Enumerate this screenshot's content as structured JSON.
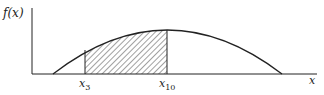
{
  "diagram": {
    "y_axis_label": "f(x)",
    "x_axis_label": "x",
    "marker_left": {
      "base": "x",
      "sub": "3"
    },
    "marker_right": {
      "base": "x",
      "sub": "10"
    },
    "colors": {
      "stroke": "#222222",
      "hatch": "#444444",
      "background": "#ffffff"
    }
  }
}
